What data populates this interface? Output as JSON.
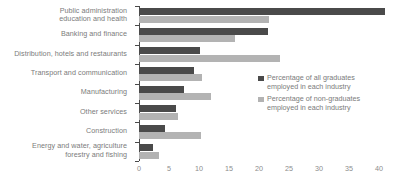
{
  "chart_data": {
    "type": "bar",
    "orientation": "horizontal",
    "title": "",
    "xlabel": "%",
    "ylabel": "",
    "xlim": [
      0,
      42
    ],
    "xticks": [
      0,
      5,
      10,
      15,
      20,
      25,
      30,
      35,
      40
    ],
    "xtick_labels": [
      "0",
      "5",
      "10",
      "15",
      "20",
      "25",
      "30",
      "35",
      "40"
    ],
    "unit_label": "%",
    "grid": false,
    "legend_position": "right",
    "categories": [
      "Public administration\neducation and health",
      "Banking and finance",
      "Distribution, hotels and restaurants",
      "Transport and communication",
      "Manufacturing",
      "Other services",
      "Construction",
      "Energy and water, agriculture\nforestry and fishing"
    ],
    "series": [
      {
        "name": "Percentage of all graduates employed in each industry",
        "color": "#4a4a4a",
        "values": [
          41.0,
          21.5,
          10.2,
          9.2,
          7.5,
          6.2,
          4.3,
          2.4
        ]
      },
      {
        "name": "Percentage of non-graduates employed in each industry",
        "color": "#b3b3b3",
        "values": [
          21.7,
          16.0,
          23.5,
          10.5,
          12.0,
          6.5,
          10.3,
          3.3
        ]
      }
    ]
  },
  "categories_display": [
    {
      "line1": "Public administration",
      "line2": "education and health"
    },
    {
      "line1": "Banking and finance",
      "line2": ""
    },
    {
      "line1": "Distribution, hotels and restaurants",
      "line2": ""
    },
    {
      "line1": "Transport and communication",
      "line2": ""
    },
    {
      "line1": "Manufacturing",
      "line2": ""
    },
    {
      "line1": "Other services",
      "line2": ""
    },
    {
      "line1": "Construction",
      "line2": ""
    },
    {
      "line1": "Energy and water, agriculture",
      "line2": "forestry and fishing"
    }
  ],
  "legend": {
    "items": [
      {
        "line1": "Percentage of all graduates",
        "line2": "employed in each industry",
        "color": "#4a4a4a"
      },
      {
        "line1": "Percentage of non-graduates",
        "line2": "employed in each industry",
        "color": "#b3b3b3"
      }
    ]
  }
}
